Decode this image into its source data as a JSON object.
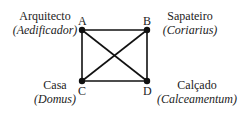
{
  "diagram": {
    "nodes": [
      {
        "id": "A",
        "letter": "A",
        "label": "Arquitecto",
        "latin": "Aedificador",
        "x": 82,
        "y": 30
      },
      {
        "id": "B",
        "letter": "B",
        "label": "Sapateiro",
        "latin": "Coriarius",
        "x": 147,
        "y": 30
      },
      {
        "id": "C",
        "letter": "C",
        "label": "Casa",
        "latin": "Domus",
        "x": 82,
        "y": 81
      },
      {
        "id": "D",
        "letter": "D",
        "label": "Calçado",
        "latin": "Calceamentum",
        "x": 147,
        "y": 81
      }
    ],
    "edges": [
      [
        "A",
        "B"
      ],
      [
        "A",
        "C"
      ],
      [
        "B",
        "D"
      ],
      [
        "C",
        "D"
      ],
      [
        "A",
        "D"
      ],
      [
        "B",
        "C"
      ]
    ],
    "line_color": "#111111"
  },
  "text": {
    "A_label": "Arquitecto",
    "A_latin": "(Aedificador)",
    "A_letter": "A",
    "B_label": "Sapateiro",
    "B_latin": "(Coriarius)",
    "B_letter": "B",
    "C_label": "Casa",
    "C_latin": "(Domus)",
    "C_letter": "C",
    "D_label": "Calçado",
    "D_latin": "(Calceamentum)",
    "D_letter": "D"
  }
}
